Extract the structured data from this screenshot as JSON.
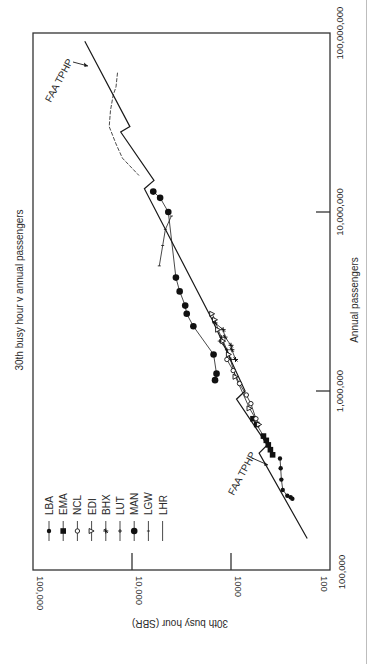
{
  "chart_data": {
    "type": "line",
    "orientation": "rotated-90-clockwise",
    "title": "30th busy hour v annual passengers",
    "xlabel": "Annual passengers",
    "ylabel": "30th busy hour (SBR)",
    "xscale": "log",
    "yscale": "log",
    "xlim": [
      100000,
      100000000
    ],
    "ylim": [
      100,
      100000
    ],
    "x_ticks": [
      "100,000",
      "1,000,000",
      "10,000,000",
      "100,000,000"
    ],
    "y_ticks": [
      "100",
      "1000",
      "10,000",
      "100,000"
    ],
    "grid": false,
    "legend_position": "upper-left (inside plot)",
    "legend": [
      {
        "label": "LBA",
        "marker": "small-filled-diamond"
      },
      {
        "label": "EMA",
        "marker": "filled-square"
      },
      {
        "label": "NCL",
        "marker": "open-circle"
      },
      {
        "label": "EDI",
        "marker": "open-triangle"
      },
      {
        "label": "BHX",
        "marker": "star"
      },
      {
        "label": "LUT",
        "marker": "plus"
      },
      {
        "label": "MAN",
        "marker": "filled-circle"
      },
      {
        "label": "LGW",
        "marker": "tick"
      },
      {
        "label": "LHR",
        "marker": "dash"
      }
    ],
    "annotations": [
      {
        "text": "FAA TPHP",
        "note": "upper arrow, near 60,000,000 passengers"
      },
      {
        "text": "FAA TPHP",
        "note": "lower arrow, near 400,000 passengers"
      }
    ],
    "series": [
      {
        "name": "FAA TPHP",
        "style": "line",
        "points": [
          [
            90000000,
            30000
          ],
          [
            30000000,
            10500
          ],
          [
            28000000,
            13000
          ],
          [
            15000000,
            6000
          ],
          [
            13500000,
            7500
          ],
          [
            2500000,
            1550
          ],
          [
            1000000,
            720
          ],
          [
            900000,
            880
          ],
          [
            500000,
            430
          ],
          [
            450000,
            520
          ],
          [
            150000,
            170
          ]
        ]
      },
      {
        "name": "LBA",
        "marker": "small-filled-diamond",
        "points": [
          [
            420000,
            320
          ],
          [
            370000,
            315
          ],
          [
            320000,
            310
          ],
          [
            280000,
            300
          ],
          [
            260000,
            270
          ],
          [
            255000,
            250
          ],
          [
            250000,
            240
          ]
        ]
      },
      {
        "name": "EMA",
        "marker": "filled-square",
        "points": [
          [
            700000,
            600
          ],
          [
            650000,
            550
          ],
          [
            560000,
            470
          ],
          [
            530000,
            440
          ],
          [
            500000,
            420
          ],
          [
            470000,
            400
          ],
          [
            440000,
            380
          ]
        ]
      },
      {
        "name": "NCL",
        "marker": "open-circle",
        "points": [
          [
            1500000,
            1100
          ],
          [
            1300000,
            950
          ],
          [
            1100000,
            820
          ],
          [
            950000,
            700
          ],
          [
            850000,
            630
          ],
          [
            700000,
            560
          ]
        ]
      },
      {
        "name": "EDI",
        "marker": "open-triangle",
        "points": [
          [
            2700000,
            1550
          ],
          [
            2500000,
            1450
          ],
          [
            2200000,
            1350
          ],
          [
            1900000,
            1200
          ],
          [
            1600000,
            1050
          ],
          [
            1200000,
            900
          ],
          [
            800000,
            650
          ],
          [
            650000,
            520
          ]
        ]
      },
      {
        "name": "BHX",
        "marker": "star",
        "points": [
          [
            2400000,
            1450
          ],
          [
            2200000,
            1200
          ],
          [
            2000000,
            1150
          ],
          [
            1800000,
            1000
          ],
          [
            1700000,
            980
          ],
          [
            1500000,
            900
          ]
        ]
      },
      {
        "name": "LUT",
        "marker": "plus",
        "points": [
          [
            2000000,
            1250
          ],
          [
            1900000,
            1300
          ],
          [
            1700000,
            1100
          ],
          [
            1500000,
            1000
          ]
        ]
      },
      {
        "name": "MAN",
        "marker": "filled-circle",
        "points": [
          [
            13000000,
            6100
          ],
          [
            12000000,
            5200
          ],
          [
            10000000,
            4300
          ],
          [
            4300000,
            3600
          ],
          [
            3600000,
            3300
          ],
          [
            3000000,
            2900
          ],
          [
            2700000,
            2800
          ],
          [
            2300000,
            2400
          ],
          [
            1600000,
            1500
          ],
          [
            1250000,
            1400
          ],
          [
            1150000,
            1450
          ]
        ]
      },
      {
        "name": "LGW",
        "marker": "tick",
        "points": [
          [
            9500000,
            4000
          ],
          [
            8000000,
            4600
          ],
          [
            6500000,
            4900
          ],
          [
            5000000,
            5300
          ]
        ]
      },
      {
        "name": "LHR",
        "marker": "dash",
        "points": [
          [
            60000000,
            14000
          ],
          [
            50000000,
            14500
          ],
          [
            45000000,
            15500
          ],
          [
            37000000,
            16500
          ],
          [
            30000000,
            17000
          ],
          [
            24000000,
            14500
          ],
          [
            20000000,
            12500
          ],
          [
            16000000,
            8500
          ]
        ]
      }
    ]
  }
}
